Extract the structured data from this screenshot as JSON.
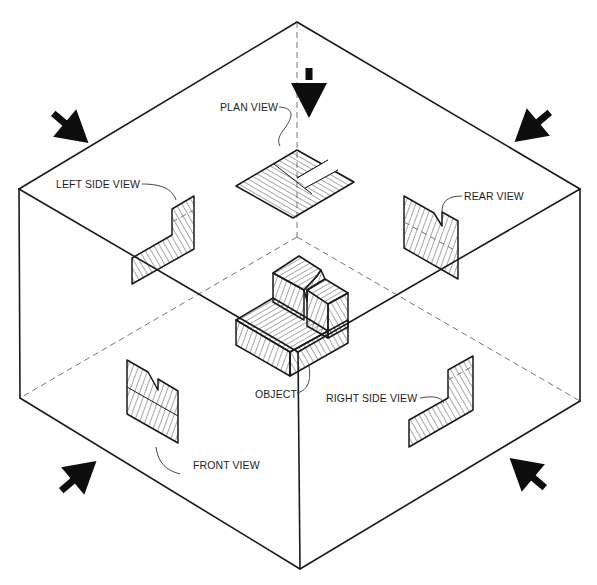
{
  "figure": {
    "background": "#ffffff",
    "ink_color": "#1a1a1a"
  },
  "labels": {
    "plan_view": "PLAN VIEW",
    "left_side_view": "LEFT SIDE VIEW",
    "rear_view": "REAR VIEW",
    "object": "OBJECT",
    "right_side_view": "RIGHT SIDE VIEW",
    "front_view": "FRONT VIEW"
  },
  "arrows": [
    {
      "name": "arrow-top",
      "direction": "down"
    },
    {
      "name": "arrow-top-left",
      "direction": "down-right"
    },
    {
      "name": "arrow-top-right",
      "direction": "down-left"
    },
    {
      "name": "arrow-bottom-left",
      "direction": "up-right"
    },
    {
      "name": "arrow-bottom-right",
      "direction": "up-left"
    }
  ],
  "box": {
    "vertices": {
      "top": [
        297,
        22
      ],
      "left_top": [
        19,
        189
      ],
      "right_top": [
        580,
        189
      ],
      "front_top": [
        298,
        352
      ],
      "left_bottom": [
        20,
        398
      ],
      "right_bottom": [
        580,
        401
      ],
      "bottom": [
        300,
        569
      ],
      "back_bottom": [
        297,
        237
      ]
    }
  }
}
